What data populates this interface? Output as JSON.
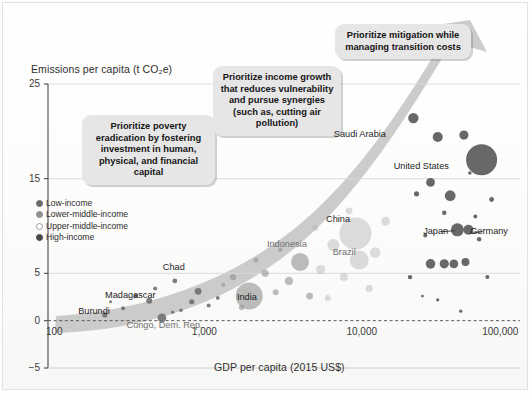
{
  "figure": {
    "y_axis_title": "Emissions per capita (t CO₂e)",
    "x_axis_title": "GDP per capita (2015 US$)"
  },
  "legend": {
    "items": [
      {
        "label": "Low-income",
        "color": "#6b6b6b",
        "filled": true
      },
      {
        "label": "Lower-middle-income",
        "color": "#8f8f8f",
        "filled": true
      },
      {
        "label": "Upper-middle-income",
        "color": "#9a9a9a",
        "filled": false
      },
      {
        "label": "High-income",
        "color": "#4a4a4a",
        "filled": true
      }
    ]
  },
  "callouts": {
    "one": "Prioritize poverty eradication by fostering investment in human, physical, and financial capital",
    "two": "Prioritize income growth that reduces vulnerability and pursue synergies (such as, cutting air pollution)",
    "three": "Prioritize mitigation while managing transition costs"
  },
  "chart_data": {
    "type": "scatter",
    "title": "",
    "xlabel": "GDP per capita (2015 US$)",
    "ylabel": "Emissions per capita (t CO₂e)",
    "x_scale": "log",
    "xlim": [
      100,
      100000
    ],
    "ylim": [
      -5,
      25
    ],
    "xticks": [
      100,
      1000,
      10000,
      100000
    ],
    "xtick_labels": [
      "100",
      "1,000",
      "10,000",
      "100,000"
    ],
    "yticks": [
      -5,
      0,
      5,
      15,
      25
    ],
    "ytick_labels": [
      "-5",
      "0",
      "5",
      "15",
      "25"
    ],
    "gridlines": {
      "y": [
        5,
        15,
        25
      ],
      "zero_line_dashed": true
    },
    "legend_position": "inside-left",
    "bubble_size_meaning": "population",
    "series": [
      {
        "name": "Low-income",
        "color": "#6b6b6b",
        "points": [
          {
            "label": "Burundi",
            "x": 230,
            "y": 0.6,
            "r": 2.6
          },
          {
            "label": "Congo, Dem. Rep.",
            "x": 530,
            "y": 0.3,
            "r": 4.4
          },
          {
            "label": "Madagascar",
            "x": 440,
            "y": 2.1,
            "r": 3.0
          },
          {
            "label": "Chad",
            "x": 640,
            "y": 4.2,
            "r": 2.4
          },
          {
            "label": "",
            "x": 300,
            "y": 1.3,
            "r": 2.0
          },
          {
            "label": "",
            "x": 360,
            "y": 2.6,
            "r": 2.2
          },
          {
            "label": "",
            "x": 700,
            "y": 1.1,
            "r": 1.8
          },
          {
            "label": "",
            "x": 820,
            "y": 2.0,
            "r": 2.6
          },
          {
            "label": "",
            "x": 900,
            "y": 3.1,
            "r": 3.4
          },
          {
            "label": "",
            "x": 1050,
            "y": 1.6,
            "r": 2.0
          },
          {
            "label": "",
            "x": 480,
            "y": 3.4,
            "r": 2.1
          },
          {
            "label": "",
            "x": 250,
            "y": 2.0,
            "r": 1.5
          },
          {
            "label": "",
            "x": 620,
            "y": 0.9,
            "r": 1.6
          },
          {
            "label": "",
            "x": 1200,
            "y": 2.4,
            "r": 1.9
          }
        ]
      },
      {
        "name": "Lower-middle-income",
        "color": "#8e8e8e",
        "points": [
          {
            "label": "India",
            "x": 1900,
            "y": 2.6,
            "r": 13.5
          },
          {
            "label": "Indonesia",
            "x": 4000,
            "y": 6.2,
            "r": 9.0
          },
          {
            "label": "",
            "x": 1500,
            "y": 4.6,
            "r": 3.2
          },
          {
            "label": "",
            "x": 2400,
            "y": 5.0,
            "r": 3.6
          },
          {
            "label": "",
            "x": 2800,
            "y": 3.0,
            "r": 3.0
          },
          {
            "label": "",
            "x": 3400,
            "y": 4.2,
            "r": 4.2
          },
          {
            "label": "",
            "x": 1700,
            "y": 1.4,
            "r": 2.6
          },
          {
            "label": "",
            "x": 2100,
            "y": 6.4,
            "r": 2.4
          },
          {
            "label": "",
            "x": 4600,
            "y": 2.6,
            "r": 3.4
          },
          {
            "label": "",
            "x": 3000,
            "y": 7.5,
            "r": 2.2
          },
          {
            "label": "",
            "x": 1300,
            "y": 3.8,
            "r": 2.0
          }
        ]
      },
      {
        "name": "Upper-middle-income",
        "color": "#b4b4b4",
        "points": [
          {
            "label": "China",
            "x": 9000,
            "y": 9.2,
            "r": 16.0
          },
          {
            "label": "Brazil",
            "x": 9500,
            "y": 6.4,
            "r": 9.5
          },
          {
            "label": "",
            "x": 6500,
            "y": 8.0,
            "r": 6.0
          },
          {
            "label": "",
            "x": 5400,
            "y": 5.4,
            "r": 4.6
          },
          {
            "label": "",
            "x": 7600,
            "y": 4.6,
            "r": 4.0
          },
          {
            "label": "",
            "x": 12000,
            "y": 7.2,
            "r": 5.2
          },
          {
            "label": "",
            "x": 14000,
            "y": 10.5,
            "r": 4.4
          },
          {
            "label": "",
            "x": 8200,
            "y": 11.6,
            "r": 3.4
          },
          {
            "label": "",
            "x": 5000,
            "y": 9.8,
            "r": 3.0
          },
          {
            "label": "",
            "x": 11000,
            "y": 3.4,
            "r": 3.6
          },
          {
            "label": "",
            "x": 6000,
            "y": 2.4,
            "r": 3.0
          }
        ]
      },
      {
        "name": "High-income",
        "color": "#4f4f4f",
        "points": [
          {
            "label": "United States",
            "x": 57000,
            "y": 17.0,
            "r": 15.5
          },
          {
            "label": "Saudi Arabia",
            "x": 21000,
            "y": 21.4,
            "r": 5.2
          },
          {
            "label": "Japan",
            "x": 40000,
            "y": 9.6,
            "r": 6.5
          },
          {
            "label": "Germany",
            "x": 47000,
            "y": 9.6,
            "r": 5.0
          },
          {
            "label": "",
            "x": 30000,
            "y": 19.4,
            "r": 5.0
          },
          {
            "label": "",
            "x": 44000,
            "y": 19.6,
            "r": 4.6
          },
          {
            "label": "",
            "x": 27000,
            "y": 14.6,
            "r": 4.4
          },
          {
            "label": "",
            "x": 36000,
            "y": 13.2,
            "r": 5.4
          },
          {
            "label": "",
            "x": 22000,
            "y": 13.4,
            "r": 2.6
          },
          {
            "label": "",
            "x": 66000,
            "y": 12.8,
            "r": 2.4
          },
          {
            "label": "",
            "x": 33000,
            "y": 11.4,
            "r": 2.2
          },
          {
            "label": "",
            "x": 52000,
            "y": 11.0,
            "r": 2.0
          },
          {
            "label": "",
            "x": 27000,
            "y": 6.0,
            "r": 4.8
          },
          {
            "label": "",
            "x": 33000,
            "y": 6.0,
            "r": 4.6
          },
          {
            "label": "",
            "x": 38000,
            "y": 6.0,
            "r": 4.4
          },
          {
            "label": "",
            "x": 45000,
            "y": 6.2,
            "r": 4.0
          },
          {
            "label": "",
            "x": 20000,
            "y": 4.6,
            "r": 2.2
          },
          {
            "label": "",
            "x": 62000,
            "y": 4.6,
            "r": 2.0
          },
          {
            "label": "",
            "x": 55000,
            "y": 8.6,
            "r": 2.2
          },
          {
            "label": "",
            "x": 25000,
            "y": 9.0,
            "r": 2.0
          },
          {
            "label": "",
            "x": 30000,
            "y": 2.2,
            "r": 1.6
          },
          {
            "label": "",
            "x": 42000,
            "y": 1.0,
            "r": 1.6
          },
          {
            "label": "",
            "x": 24000,
            "y": 2.6,
            "r": 1.4
          },
          {
            "label": "",
            "x": 48000,
            "y": 15.6,
            "r": 1.8
          }
        ]
      }
    ],
    "annotations": [
      {
        "text": "Saudi Arabia",
        "x": 15500,
        "y": 19.6,
        "anchor": "end"
      },
      {
        "text": "United States",
        "x": 40000,
        "y": 16.2,
        "anchor": "end"
      },
      {
        "text": "China",
        "x": 7000,
        "y": 10.6,
        "anchor": "middle"
      },
      {
        "text": "Japan",
        "x": 29000,
        "y": 9.4,
        "anchor": "middle"
      },
      {
        "text": "Germany",
        "x": 62000,
        "y": 9.4,
        "anchor": "middle"
      },
      {
        "text": "Brazil",
        "x": 8000,
        "y": 7.2,
        "anchor": "middle"
      },
      {
        "text": "Indonesia",
        "x": 3400,
        "y": 8.0,
        "anchor": "middle"
      },
      {
        "text": "India",
        "x": 1900,
        "y": 2.4,
        "anchor": "middle"
      },
      {
        "text": "Chad",
        "x": 620,
        "y": 5.6,
        "anchor": "middle"
      },
      {
        "text": "Madagascar",
        "x": 330,
        "y": 2.6,
        "anchor": "middle"
      },
      {
        "text": "Burundi",
        "x": 200,
        "y": 0.9,
        "anchor": "middle"
      },
      {
        "text": "Congo, Dem. Rep.",
        "x": 560,
        "y": -0.6,
        "anchor": "middle"
      }
    ],
    "arrow": {
      "description": "Thick grey upward-sweeping arrow from lower-left to upper-right behind the callouts",
      "color": "#b9b9b9"
    }
  }
}
